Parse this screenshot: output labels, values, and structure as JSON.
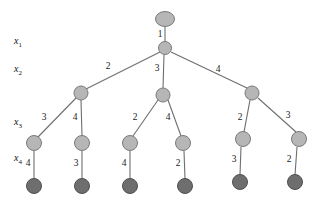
{
  "diagram": {
    "kind": "decision-tree",
    "colors": {
      "internal_node_fill": "#b6b6b6",
      "internal_node_stroke": "#7a7a7a",
      "leaf_node_fill": "#6e6e6e",
      "leaf_node_stroke": "#4f4f4f",
      "edge_stroke": "#6e6e6e",
      "label_color": "#1a1a1a",
      "background": "#ffffff"
    },
    "level_labels": [
      {
        "id": "level-x1",
        "base": "x",
        "sub": "1",
        "x": 14,
        "y": 42
      },
      {
        "id": "level-x2",
        "base": "x",
        "sub": "2",
        "x": 14,
        "y": 70
      },
      {
        "id": "level-x3",
        "base": "x",
        "sub": "3",
        "x": 14,
        "y": 123
      },
      {
        "id": "level-x4",
        "base": "x",
        "sub": "4",
        "x": 14,
        "y": 159
      }
    ],
    "nodes": [
      {
        "id": "root",
        "type": "ellipse",
        "role": "internal",
        "cx": 165,
        "cy": 19,
        "rx": 9.5,
        "ry": 7.5
      },
      {
        "id": "n-x1",
        "type": "circle",
        "role": "internal",
        "cx": 165,
        "cy": 48,
        "r": 6.5
      },
      {
        "id": "n-x2-a",
        "type": "circle",
        "role": "internal",
        "cx": 81,
        "cy": 93,
        "r": 7
      },
      {
        "id": "n-x2-b",
        "type": "circle",
        "role": "internal",
        "cx": 163,
        "cy": 95,
        "r": 7
      },
      {
        "id": "n-x2-c",
        "type": "circle",
        "role": "internal",
        "cx": 252,
        "cy": 93,
        "r": 7
      },
      {
        "id": "n-x3-a",
        "type": "circle",
        "role": "internal",
        "cx": 34,
        "cy": 143,
        "r": 7.5
      },
      {
        "id": "n-x3-b",
        "type": "circle",
        "role": "internal",
        "cx": 82,
        "cy": 143,
        "r": 7.5
      },
      {
        "id": "n-x3-c",
        "type": "circle",
        "role": "internal",
        "cx": 130,
        "cy": 143,
        "r": 7.5
      },
      {
        "id": "n-x3-d",
        "type": "circle",
        "role": "internal",
        "cx": 183,
        "cy": 143,
        "r": 7.5
      },
      {
        "id": "n-x3-e",
        "type": "circle",
        "role": "internal",
        "cx": 243,
        "cy": 139,
        "r": 7.5
      },
      {
        "id": "n-x3-f",
        "type": "circle",
        "role": "internal",
        "cx": 299,
        "cy": 139,
        "r": 7.5
      },
      {
        "id": "n-x4-a",
        "type": "circle",
        "role": "leaf",
        "cx": 34,
        "cy": 186,
        "r": 7.5
      },
      {
        "id": "n-x4-b",
        "type": "circle",
        "role": "leaf",
        "cx": 82,
        "cy": 186,
        "r": 7.5
      },
      {
        "id": "n-x4-c",
        "type": "circle",
        "role": "leaf",
        "cx": 130,
        "cy": 186,
        "r": 7.5
      },
      {
        "id": "n-x4-d",
        "type": "circle",
        "role": "leaf",
        "cx": 185,
        "cy": 186,
        "r": 7.5
      },
      {
        "id": "n-x4-e",
        "type": "circle",
        "role": "leaf",
        "cx": 240,
        "cy": 182,
        "r": 7.5
      },
      {
        "id": "n-x4-f",
        "type": "circle",
        "role": "leaf",
        "cx": 295,
        "cy": 182,
        "r": 7.5
      }
    ],
    "edges": [
      {
        "id": "e-root-x1",
        "from": "root",
        "to": "n-x1",
        "x1": 165,
        "y1": 27,
        "x2": 165,
        "y2": 42,
        "label": "1",
        "lx": 160,
        "ly": 35
      },
      {
        "id": "e-x1-x2a",
        "from": "n-x1",
        "to": "n-x2-a",
        "x1": 160,
        "y1": 52,
        "x2": 86,
        "y2": 89,
        "label": "2",
        "lx": 108,
        "ly": 67
      },
      {
        "id": "e-x1-x2b",
        "from": "n-x1",
        "to": "n-x2-b",
        "x1": 164,
        "y1": 55,
        "x2": 163,
        "y2": 88,
        "label": "3",
        "lx": 157,
        "ly": 69
      },
      {
        "id": "e-x1-x2c",
        "from": "n-x1",
        "to": "n-x2-c",
        "x1": 171,
        "y1": 52,
        "x2": 247,
        "y2": 88,
        "label": "4",
        "lx": 218,
        "ly": 70
      },
      {
        "id": "e-x2a-x3a",
        "from": "n-x2-a",
        "to": "n-x3-a",
        "x1": 76,
        "y1": 98,
        "x2": 38,
        "y2": 137,
        "label": "3",
        "lx": 44,
        "ly": 118
      },
      {
        "id": "e-x2a-x3b",
        "from": "n-x2-a",
        "to": "n-x3-b",
        "x1": 81,
        "y1": 100,
        "x2": 82,
        "y2": 136,
        "label": "4",
        "lx": 75,
        "ly": 118
      },
      {
        "id": "e-x2b-x3c",
        "from": "n-x2-b",
        "to": "n-x3-c",
        "x1": 158,
        "y1": 100,
        "x2": 133,
        "y2": 136,
        "label": "2",
        "lx": 135,
        "ly": 118
      },
      {
        "id": "e-x2b-x3d",
        "from": "n-x2-b",
        "to": "n-x3-d",
        "x1": 168,
        "y1": 100,
        "x2": 181,
        "y2": 136,
        "label": "4",
        "lx": 168,
        "ly": 118
      },
      {
        "id": "e-x2c-x3e",
        "from": "n-x2-c",
        "to": "n-x3-e",
        "x1": 250,
        "y1": 100,
        "x2": 244,
        "y2": 132,
        "label": "2",
        "lx": 240,
        "ly": 118
      },
      {
        "id": "e-x2c-x3f",
        "from": "n-x2-c",
        "to": "n-x3-f",
        "x1": 258,
        "y1": 98,
        "x2": 296,
        "y2": 132,
        "label": "3",
        "lx": 288,
        "ly": 116
      },
      {
        "id": "e-x3a-x4a",
        "from": "n-x3-a",
        "to": "n-x4-a",
        "x1": 34,
        "y1": 151,
        "x2": 34,
        "y2": 179,
        "label": "4",
        "lx": 28,
        "ly": 164
      },
      {
        "id": "e-x3b-x4b",
        "from": "n-x3-b",
        "to": "n-x4-b",
        "x1": 82,
        "y1": 151,
        "x2": 82,
        "y2": 179,
        "label": "3",
        "lx": 76,
        "ly": 164
      },
      {
        "id": "e-x3c-x4c",
        "from": "n-x3-c",
        "to": "n-x4-c",
        "x1": 130,
        "y1": 151,
        "x2": 130,
        "y2": 179,
        "label": "4",
        "lx": 124,
        "ly": 164
      },
      {
        "id": "e-x3d-x4d",
        "from": "n-x3-d",
        "to": "n-x4-d",
        "x1": 184,
        "y1": 151,
        "x2": 185,
        "y2": 179,
        "label": "2",
        "lx": 178,
        "ly": 164
      },
      {
        "id": "e-x3e-x4e",
        "from": "n-x3-e",
        "to": "n-x4-e",
        "x1": 241,
        "y1": 147,
        "x2": 240,
        "y2": 175,
        "label": "3",
        "lx": 234,
        "ly": 160
      },
      {
        "id": "e-x3f-x4f",
        "from": "n-x3-f",
        "to": "n-x4-f",
        "x1": 297,
        "y1": 147,
        "x2": 295,
        "y2": 175,
        "label": "2",
        "lx": 289,
        "ly": 160
      }
    ]
  }
}
